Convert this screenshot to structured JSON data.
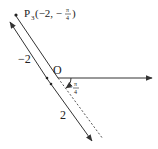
{
  "diagram": {
    "type": "polar-coordinate-diagram",
    "pole_label": "O",
    "point": {
      "name": "P",
      "subscript": "3",
      "coords_text": "(−2, −",
      "angle_num": "π",
      "angle_den": "4",
      "close": ")"
    },
    "angle_label": {
      "sign": "−",
      "num": "π",
      "den": "4"
    },
    "segment_labels": {
      "negative": "−2",
      "positive": "2"
    },
    "colors": {
      "line": "#333333",
      "text": "#222222",
      "background": "#ffffff"
    }
  }
}
